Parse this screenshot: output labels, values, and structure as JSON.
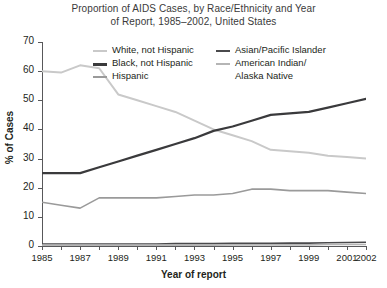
{
  "chart_data": {
    "type": "line",
    "title": "Proportion of AIDS Cases, by Race/Ethnicity and Year of Report, 1985–2002, United States",
    "title_line1": "Proportion of AIDS Cases, by Race/Ethnicity and Year",
    "title_line2": "of Report, 1985–2002, United States",
    "xlabel": "Year of report",
    "ylabel": "% of Cases",
    "ylim": [
      0,
      70
    ],
    "xlim": [
      1985,
      2002
    ],
    "yticks": [
      0,
      10,
      20,
      30,
      40,
      50,
      60,
      70
    ],
    "xticks": [
      1985,
      1986,
      1987,
      1988,
      1989,
      1990,
      1991,
      1992,
      1993,
      1994,
      1995,
      1996,
      1997,
      1998,
      1999,
      2000,
      2001,
      2002
    ],
    "xtick_labels": [
      "1985",
      "1987",
      "1989",
      "1991",
      "1993",
      "1995",
      "1997",
      "1999",
      "2001",
      "2002"
    ],
    "xtick_label_years": [
      1985,
      1987,
      1989,
      1991,
      1993,
      1995,
      1997,
      1999,
      2001,
      2002
    ],
    "grid": false,
    "legend_position": "inside-top",
    "x": [
      1985,
      1986,
      1987,
      1988,
      1989,
      1990,
      1991,
      1992,
      1993,
      1994,
      1995,
      1996,
      1997,
      1998,
      1999,
      2000,
      2001,
      2002
    ],
    "series": [
      {
        "name": "White, not Hispanic",
        "color": "#c9c9c9",
        "width": 2,
        "values": [
          60,
          59.5,
          62,
          61,
          52,
          50,
          48,
          46,
          43,
          40,
          38,
          36,
          33,
          32.5,
          32,
          31,
          30.5,
          30
        ]
      },
      {
        "name": "Black, not Hispanic",
        "color": "#3a3a3c",
        "width": 2.2,
        "values": [
          25,
          25,
          25,
          27,
          29,
          31,
          33,
          35,
          37,
          39.5,
          41,
          43,
          45,
          45.5,
          46,
          47.5,
          49,
          50.5
        ]
      },
      {
        "name": "Hispanic",
        "color": "#9a9a9a",
        "width": 1.6,
        "values": [
          15,
          14,
          13,
          16.5,
          16.5,
          16.5,
          16.5,
          17,
          17.5,
          17.5,
          18,
          19.5,
          19.5,
          19,
          19,
          19,
          18.5,
          18
        ]
      },
      {
        "name": "Asian/Pacific Islander",
        "color": "#4a4a4c",
        "width": 1.6,
        "values": [
          0.7,
          0.7,
          0.7,
          0.7,
          0.7,
          0.7,
          0.7,
          0.8,
          0.8,
          0.8,
          0.9,
          0.9,
          0.9,
          1.0,
          1.0,
          1.1,
          1.2,
          1.3
        ]
      },
      {
        "name": "American Indian/Alaska Native",
        "color": "#b5b5b5",
        "width": 1.6,
        "values": [
          0.3,
          0.3,
          0.3,
          0.3,
          0.3,
          0.3,
          0.3,
          0.3,
          0.3,
          0.3,
          0.4,
          0.4,
          0.4,
          0.4,
          0.4,
          0.5,
          0.5,
          0.5
        ]
      }
    ],
    "legend": [
      {
        "label": "White, not Hispanic",
        "color": "#c9c9c9",
        "width": 2,
        "column": 1
      },
      {
        "label": "Black, not Hispanic",
        "color": "#3a3a3c",
        "width": 3,
        "column": 1
      },
      {
        "label": "Hispanic",
        "color": "#9a9a9a",
        "width": 1.6,
        "column": 1
      },
      {
        "label": "Asian/Pacific Islander",
        "color": "#4a4a4c",
        "width": 2.2,
        "column": 2
      },
      {
        "label": "American Indian/",
        "label2": "Alaska Native",
        "color": "#b5b5b5",
        "width": 1.6,
        "column": 2
      }
    ]
  }
}
